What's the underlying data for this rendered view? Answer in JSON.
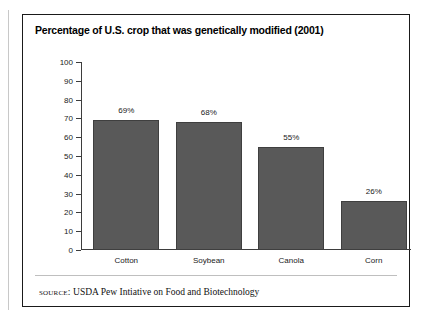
{
  "figure": {
    "title": "Percentage of U.S. crop that was genetically modified (2001)",
    "source_kicker": "source:",
    "source_text": "USDA Pew Intiative on Food and Biotechnology"
  },
  "colors": {
    "bar_fill": "#595959",
    "bar_stroke": "#3f3f3f",
    "axis": "#3d3d3d",
    "frame": "#1a1a1a",
    "text": "#1a1a1a"
  },
  "chart_data": {
    "type": "bar",
    "title": "Percentage of U.S. crop that was genetically modified (2001)",
    "xlabel": "",
    "ylabel": "",
    "ylim": [
      0,
      100
    ],
    "yticks": [
      0,
      10,
      20,
      30,
      40,
      50,
      60,
      70,
      80,
      90,
      100
    ],
    "ytick_labels": [
      "0",
      "10",
      "20",
      "30",
      "40",
      "50",
      "60",
      "70",
      "80",
      "90",
      "100"
    ],
    "grid": false,
    "legend": "none",
    "categories": [
      "Cotton",
      "Soybean",
      "Canola",
      "Corn"
    ],
    "values": [
      69,
      68,
      55,
      26
    ],
    "data_labels": [
      "69%",
      "68%",
      "55%",
      "26%"
    ]
  }
}
